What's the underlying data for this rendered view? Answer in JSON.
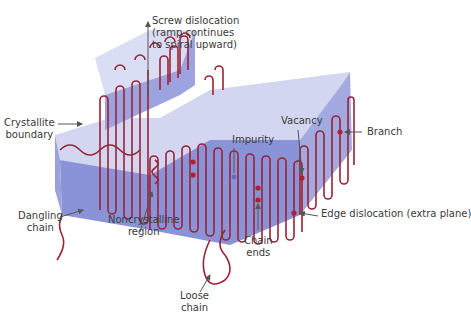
{
  "diagram": {
    "colors": {
      "chain": "#9b2335",
      "top_face": "#d2d6f0",
      "front_face": "#8a93d8",
      "side_face": "#a3aae0",
      "arrow": "#555555",
      "impurity": "#5b6fc4",
      "defect_dot": "#b0202e"
    },
    "labels": {
      "screw_dislocation": [
        "Screw dislocation",
        "(ramp continues",
        "to spiral upward)"
      ],
      "crystallite_boundary": [
        "Crystallite",
        "boundary"
      ],
      "branch": "Branch",
      "vacancy": "Vacancy",
      "impurity": "Impurity",
      "dangling_chain": [
        "Dangling",
        "chain"
      ],
      "noncrystalline_region": [
        "Noncrystalline",
        "region"
      ],
      "chain_ends": [
        "Chain",
        "ends"
      ],
      "edge_dislocation": "Edge dislocation (extra plane)",
      "loose_chain": [
        "Loose",
        "chain"
      ]
    }
  }
}
